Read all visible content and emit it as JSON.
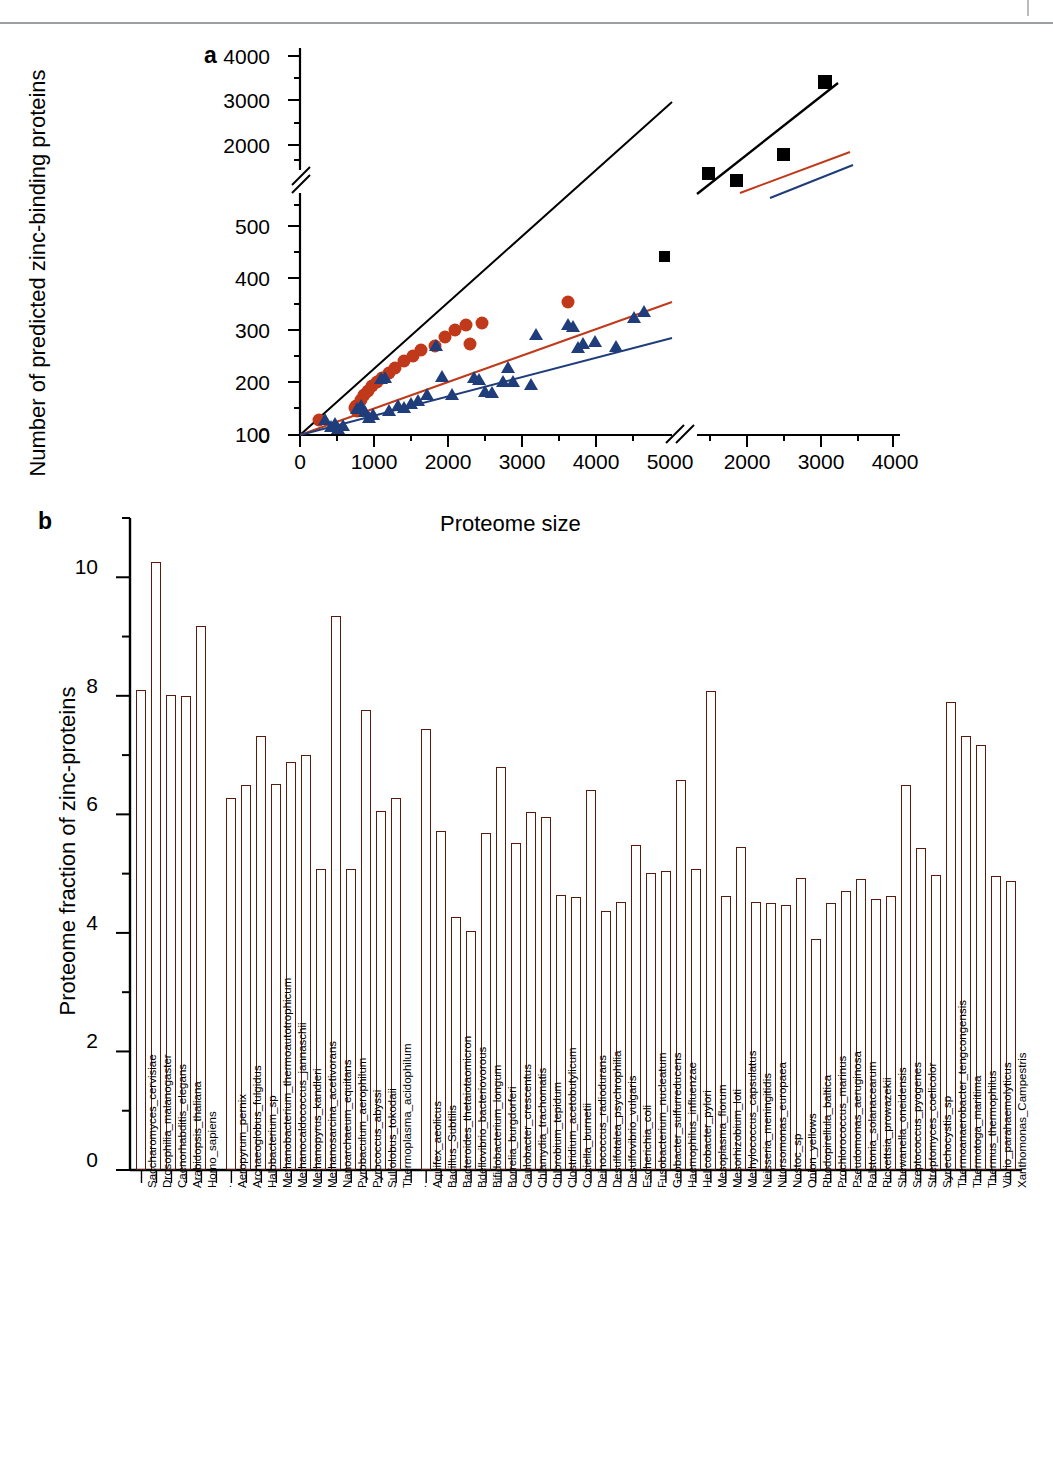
{
  "figure": {
    "panels": [
      {
        "letter": "a"
      },
      {
        "letter": "b"
      }
    ]
  },
  "chart_data": [
    {
      "type": "scatter",
      "panel": "a",
      "title": "",
      "xlabel": "Proteome size",
      "ylabel": "Number of predicted zinc-binding proteins",
      "axis_break_x": true,
      "axis_break_y": true,
      "xticks_left": [
        0,
        1000,
        2000,
        3000,
        4000,
        5000
      ],
      "xticks_right": [
        2000,
        3000,
        4000
      ],
      "yticks_lower": [
        0,
        100,
        200,
        300,
        400,
        500
      ],
      "yticks_upper": [
        2000,
        3000,
        4000
      ],
      "xlim_left": [
        0,
        5800
      ],
      "ylim_lower": [
        0,
        560
      ],
      "legend_position": "none",
      "grid": false,
      "series": [
        {
          "name": "eukaryotes",
          "marker": "square",
          "color": "#000000",
          "points": [
            {
              "x": 5700,
              "y": 475
            },
            {
              "x": 1950,
              "y": 1950
            },
            {
              "x": 2050,
              "y": 1880
            },
            {
              "x": 3050,
              "y": 2450
            },
            {
              "x": 4050,
              "y": 3680
            }
          ]
        },
        {
          "name": "archaea",
          "marker": "circle",
          "color": "#C0391A",
          "points": [
            {
              "x": 520,
              "y": 57
            },
            {
              "x": 1500,
              "y": 92
            },
            {
              "x": 1640,
              "y": 113
            },
            {
              "x": 1700,
              "y": 105
            },
            {
              "x": 1790,
              "y": 117
            },
            {
              "x": 1860,
              "y": 148
            },
            {
              "x": 1900,
              "y": 121
            },
            {
              "x": 2030,
              "y": 150
            },
            {
              "x": 2070,
              "y": 150
            },
            {
              "x": 2450,
              "y": 158
            },
            {
              "x": 2600,
              "y": 168
            },
            {
              "x": 2620,
              "y": 131
            },
            {
              "x": 2830,
              "y": 171
            },
            {
              "x": 4500,
              "y": 228
            }
          ]
        },
        {
          "name": "bacteria",
          "marker": "triangle",
          "color": "#1F3D7A",
          "points": [
            {
              "x": 680,
              "y": 62
            },
            {
              "x": 760,
              "y": 45
            },
            {
              "x": 840,
              "y": 52
            },
            {
              "x": 860,
              "y": 40
            },
            {
              "x": 880,
              "y": 55
            },
            {
              "x": 1520,
              "y": 104
            },
            {
              "x": 1600,
              "y": 108
            },
            {
              "x": 1640,
              "y": 112
            },
            {
              "x": 1660,
              "y": 95
            },
            {
              "x": 1700,
              "y": 82
            },
            {
              "x": 1740,
              "y": 86
            },
            {
              "x": 1830,
              "y": 145
            },
            {
              "x": 1860,
              "y": 148
            },
            {
              "x": 1900,
              "y": 90
            },
            {
              "x": 2000,
              "y": 98
            },
            {
              "x": 2060,
              "y": 96
            },
            {
              "x": 2180,
              "y": 104
            },
            {
              "x": 2280,
              "y": 106
            },
            {
              "x": 2420,
              "y": 118
            },
            {
              "x": 2480,
              "y": 205
            },
            {
              "x": 2560,
              "y": 162
            },
            {
              "x": 2700,
              "y": 118
            },
            {
              "x": 3050,
              "y": 160
            },
            {
              "x": 3100,
              "y": 158
            },
            {
              "x": 3150,
              "y": 130
            },
            {
              "x": 3200,
              "y": 128
            },
            {
              "x": 3340,
              "y": 152
            },
            {
              "x": 3400,
              "y": 174
            },
            {
              "x": 3450,
              "y": 152
            },
            {
              "x": 3620,
              "y": 148
            },
            {
              "x": 3680,
              "y": 222
            },
            {
              "x": 4050,
              "y": 238
            },
            {
              "x": 4120,
              "y": 235
            },
            {
              "x": 4180,
              "y": 205
            },
            {
              "x": 4250,
              "y": 211
            },
            {
              "x": 4420,
              "y": 214
            },
            {
              "x": 4760,
              "y": 208
            },
            {
              "x": 5050,
              "y": 248
            },
            {
              "x": 5180,
              "y": 258
            }
          ]
        }
      ],
      "fit_lines": [
        {
          "name": "eukaryote-fit",
          "color": "#000000"
        },
        {
          "name": "archaea-fit",
          "color": "#C0391A"
        },
        {
          "name": "bacteria-fit",
          "color": "#1F3D7A"
        }
      ]
    },
    {
      "type": "bar",
      "panel": "b",
      "title": "",
      "xlabel": "",
      "ylabel": "Proteome fraction of zinc-proteins",
      "yticks": [
        0,
        2,
        4,
        6,
        8,
        10
      ],
      "ylim": [
        0,
        11
      ],
      "grid": false,
      "bar_color": "#C9391A",
      "groups": [
        {
          "name": "eukaryota",
          "categories": [
            "Saccharomyces_cervisiae",
            "Drosophilia_malanogaster",
            "Caenorhabditis_elegans",
            "Arabidopsis_thaliana",
            "Homo_sapiens"
          ],
          "values": [
            8.1,
            10.25,
            8.02,
            8.0,
            9.17
          ]
        },
        {
          "name": "archaea",
          "categories": [
            "Aeropyrum_pernix",
            "Archaeoglobus_fulgidus",
            "Halobacterium_sp",
            "Methanobacterium_thermoautotrophicum",
            "Methanocaldococcus_jannaschii",
            "Methanopyrus_kandleri",
            "Methanosarcina_acetivorans",
            "Nanoarchaeum_equitans",
            "Pyrobaculum_aerophilum",
            "Pyrococcus_abyssi",
            "Sulfolobus_tokodaii",
            "Thermoplasma_acidophilum"
          ],
          "values": [
            6.28,
            6.49,
            7.33,
            6.52,
            6.88,
            7.0,
            5.08,
            9.34,
            5.08,
            7.76,
            6.06,
            6.28
          ]
        },
        {
          "name": "bacteria",
          "categories": [
            "Aquifex_aeolicus",
            "Bacillus_Subtilis",
            "Bacteroides_thetaiotaomicron",
            "Bdellovibrio_bacteriovorous",
            "Bifidobacterium_longum",
            "Borrelia_burgdorferi",
            "Caulobacter_crescentus",
            "Chlamydia_trachomatis",
            "Chlorobium_tepidum",
            "Clostridium_acetobutylicum",
            "Coxiella_burnetii",
            "Deinococcus_radiodurans",
            "Desulfotalea_psychrophilia",
            "Desulfovibrio_vulgaris",
            "Escherichia_coli",
            "Fusobacterium_nucleatum",
            "Geobacter_sulfurreducens",
            "Haemophilus_influenzae",
            "Helicobacter_pylori",
            "Mesoplasma_florum",
            "Mesorhizobium_loti",
            "Methylococcus_capsulatus",
            "Neisseria_meningitidis",
            "Nitorsomonas_europaea",
            "Nostoc_sp",
            "Onion_yellows",
            "Rhodopirellula_baltica",
            "Prochlorococcus_marinus",
            "Pseudomonas_aeruginosa",
            "Ralstonia_solanacearum",
            "Rickettsia_prowazekii",
            "Shewanella_oneidensis",
            "Sreptococcus_pyogenes",
            "Streptomyces_coelicolor",
            "Synechocystis_sp",
            "Thermoanaerobacter_tengcongensis",
            "Thermotoga_maritima",
            "Thermus_thermophilus",
            "Vibrio_parahaemolyticus",
            "Xanthomonas_Campestris"
          ],
          "values": [
            7.44,
            5.72,
            4.27,
            4.03,
            5.68,
            6.8,
            5.52,
            6.04,
            5.95,
            4.64,
            4.61,
            6.41,
            4.37,
            4.52,
            5.48,
            5.01,
            5.04,
            6.58,
            5.08,
            8.08,
            4.63,
            5.45,
            4.52,
            4.5,
            4.47,
            4.92,
            3.89,
            4.51,
            4.7,
            4.91,
            4.58,
            4.62,
            6.49,
            5.44,
            4.97,
            7.9,
            7.33,
            7.17,
            4.96,
            4.87
          ]
        }
      ]
    }
  ]
}
